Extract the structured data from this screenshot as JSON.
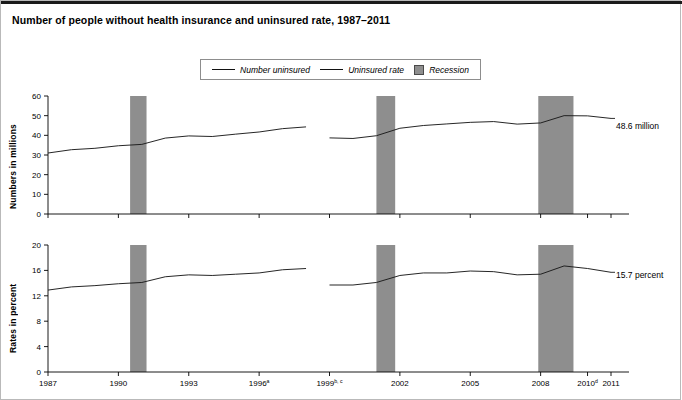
{
  "page": {
    "title": "Number of people without health insurance and uninsured rate, 1987–2011"
  },
  "legend": {
    "items": [
      {
        "label": "Number uninsured",
        "marker": "line",
        "color": "#111111"
      },
      {
        "label": "Uninsured rate",
        "marker": "line",
        "color": "#111111"
      },
      {
        "label": "Recession",
        "marker": "swatch",
        "color": "#8e8e8e"
      }
    ]
  },
  "annotations": {
    "number_end_label": "48.6 million",
    "rate_end_label": "15.7 percent"
  },
  "axes": {
    "top_y_title": "Numbers in millions",
    "bottom_y_title": "Rates in percent",
    "top_y_ticks": [
      "0",
      "10",
      "20",
      "30",
      "40",
      "50",
      "60"
    ],
    "bottom_y_ticks": [
      "0",
      "4",
      "8",
      "12",
      "16",
      "20"
    ],
    "x_ticks": [
      {
        "label": "1987",
        "sup": ""
      },
      {
        "label": "1990",
        "sup": ""
      },
      {
        "label": "1993",
        "sup": ""
      },
      {
        "label": "1996",
        "sup": "a"
      },
      {
        "label": "1999",
        "sup": "b, c"
      },
      {
        "label": "2002",
        "sup": ""
      },
      {
        "label": "2005",
        "sup": ""
      },
      {
        "label": "2008",
        "sup": ""
      },
      {
        "label": "2010",
        "sup": "d"
      },
      {
        "label": "2011",
        "sup": ""
      }
    ]
  },
  "chart_data": {
    "type": "line",
    "title": "Number of people without health insurance and uninsured rate, 1987–2011",
    "xlabel": "",
    "x": [
      1987,
      1988,
      1989,
      1990,
      1991,
      1992,
      1993,
      1994,
      1995,
      1996,
      1997,
      1998,
      1999,
      2000,
      2001,
      2002,
      2003,
      2004,
      2005,
      2006,
      2007,
      2008,
      2009,
      2010,
      2011
    ],
    "panels": [
      {
        "name": "top",
        "ylabel": "Numbers in millions",
        "ylim": [
          0,
          60
        ],
        "yticks": [
          0,
          10,
          20,
          30,
          40,
          50,
          60
        ],
        "grid": false,
        "series": [
          {
            "name": "Number uninsured",
            "units": "millions",
            "values": [
              31.0,
              32.7,
              33.4,
              34.7,
              35.4,
              38.6,
              39.7,
              39.4,
              40.6,
              41.7,
              43.4,
              44.3,
              38.7,
              38.4,
              39.8,
              43.6,
              45.0,
              45.8,
              46.6,
              47.0,
              45.7,
              46.3,
              50.0,
              49.9,
              48.6
            ],
            "break_after_year": 1998,
            "end_label": "48.6 million"
          }
        ]
      },
      {
        "name": "bottom",
        "ylabel": "Rates in percent",
        "ylim": [
          0,
          20
        ],
        "yticks": [
          0,
          4,
          8,
          12,
          16,
          20
        ],
        "grid": false,
        "series": [
          {
            "name": "Uninsured rate",
            "units": "percent",
            "values": [
              12.9,
              13.4,
              13.6,
              13.9,
              14.1,
              15.0,
              15.3,
              15.2,
              15.4,
              15.6,
              16.1,
              16.3,
              13.7,
              13.7,
              14.1,
              15.2,
              15.6,
              15.6,
              15.9,
              15.8,
              15.3,
              15.4,
              16.7,
              16.3,
              15.7
            ],
            "break_after_year": 1998,
            "end_label": "15.7 percent"
          }
        ]
      }
    ],
    "shaded_regions": [
      {
        "label": "Recession",
        "start": 1990.5,
        "end": 1991.2,
        "color": "#8e8e8e"
      },
      {
        "label": "Recession",
        "start": 2001.0,
        "end": 2001.8,
        "color": "#8e8e8e"
      },
      {
        "label": "Recession",
        "start": 2007.9,
        "end": 2009.4,
        "color": "#8e8e8e"
      }
    ]
  }
}
